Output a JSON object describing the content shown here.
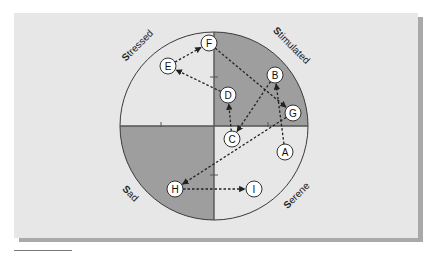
{
  "diagram": {
    "colors": {
      "panel": "#e7e7e7",
      "shadow": "#a9a9a9",
      "shaded_quadrant": "#9e9e9e",
      "light_quadrant": "#e7e7e7",
      "axis": "#555555",
      "outline": "#3a3a3a",
      "arrow": "#222222",
      "node_fill": "#ffffff"
    },
    "circle": {
      "cx": 214,
      "cy": 126,
      "r": 94
    },
    "quadrant_labels": [
      {
        "id": "stressed",
        "initial": "S",
        "rest": "tressed",
        "x": 137,
        "y": 45,
        "rotate": -45
      },
      {
        "id": "stimulated",
        "initial": "S",
        "rest": "timulated",
        "x": 292,
        "y": 45,
        "rotate": 45
      },
      {
        "id": "sad",
        "initial": "S",
        "rest": "ad",
        "x": 131,
        "y": 193,
        "rotate": 45
      },
      {
        "id": "serene",
        "initial": "S",
        "rest": "erene",
        "x": 296,
        "y": 195,
        "rotate": -45
      }
    ],
    "ticks": [
      {
        "axis": "x",
        "at": 161
      },
      {
        "axis": "x",
        "at": 268
      },
      {
        "axis": "y",
        "at": 77
      },
      {
        "axis": "y",
        "at": 175
      }
    ],
    "nodes": [
      {
        "id": "A",
        "x": 285,
        "y": 152
      },
      {
        "id": "B",
        "x": 275,
        "y": 75
      },
      {
        "id": "C",
        "x": 232,
        "y": 139
      },
      {
        "id": "D",
        "x": 228,
        "y": 95
      },
      {
        "id": "E",
        "x": 168,
        "y": 66
      },
      {
        "id": "F",
        "x": 209,
        "y": 43
      },
      {
        "id": "G",
        "x": 293,
        "y": 113
      },
      {
        "id": "H",
        "x": 175,
        "y": 189
      },
      {
        "id": "I",
        "x": 254,
        "y": 189
      }
    ],
    "edges": [
      {
        "from": "A",
        "to": "B"
      },
      {
        "from": "B",
        "to": "C"
      },
      {
        "from": "C",
        "to": "D"
      },
      {
        "from": "D",
        "to": "E"
      },
      {
        "from": "E",
        "to": "F"
      },
      {
        "from": "F",
        "to": "G"
      },
      {
        "from": "G",
        "to": "H"
      },
      {
        "from": "H",
        "to": "I"
      }
    ]
  }
}
